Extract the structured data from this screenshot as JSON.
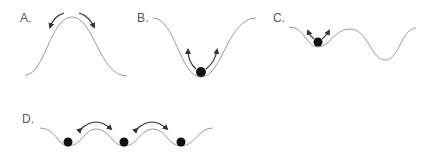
{
  "figure": {
    "colors": {
      "curve": "#9a9a9a",
      "ball": "#111111",
      "arrow": "#333333",
      "label": "#555555",
      "background": "#ffffff"
    },
    "panels": [
      {
        "id": "A",
        "label": "A.",
        "shape": "single hill",
        "balls": 0,
        "arrows": "two arrows pointing down both sides from the peak"
      },
      {
        "id": "B",
        "label": "B.",
        "shape": "single deep well",
        "balls": 1,
        "arrows": "two arrows pointing up both walls from ball at bottom"
      },
      {
        "id": "C",
        "label": "C.",
        "shape": "shallow well next to deeper well",
        "balls": 1,
        "arrows": "two short arrows pointing up from ball in shallow well"
      },
      {
        "id": "D",
        "label": "D.",
        "shape": "periodic wells",
        "balls": 3,
        "arrows": "two double-headed arrows over barriers between adjacent wells"
      }
    ]
  }
}
